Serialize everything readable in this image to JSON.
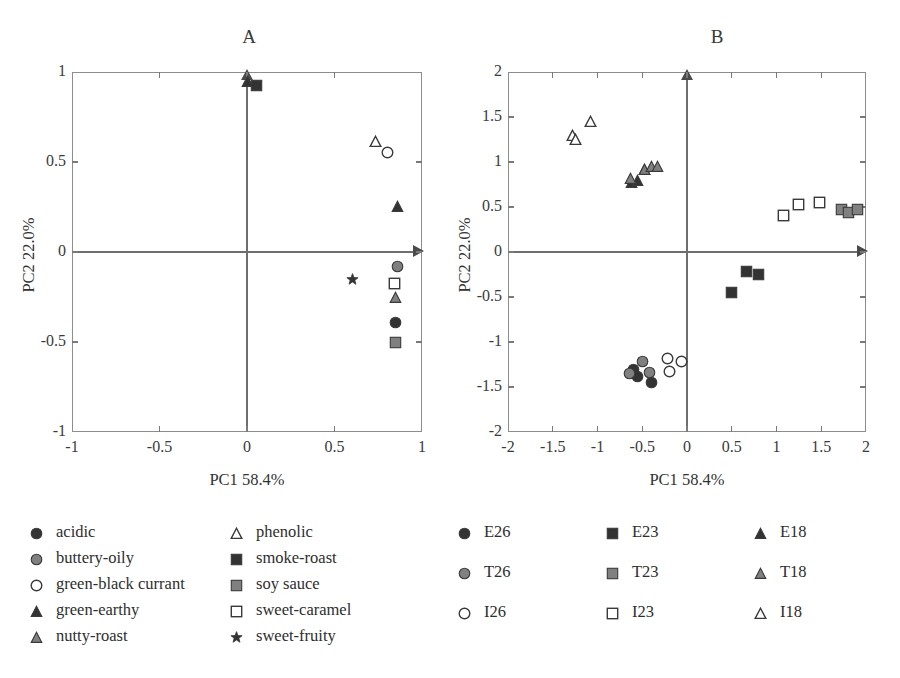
{
  "figure": {
    "panels": [
      {
        "id": "A",
        "label": "A"
      },
      {
        "id": "B",
        "label": "B"
      }
    ]
  },
  "colors": {
    "dark": "#333333",
    "mid_gray": "#808080",
    "white_fill": "#ffffff",
    "outline": "#3a3a3a",
    "axis": "#6e6e6e",
    "frame": "#8d8d8d"
  },
  "chart_data": [
    {
      "type": "scatter",
      "id": "panel-a",
      "title": "A",
      "xlabel": "PC1 58.4%",
      "ylabel": "PC2 22.0%",
      "xlim": [
        -1,
        1
      ],
      "ylim": [
        -1,
        1
      ],
      "xticks": [
        -1,
        -0.5,
        0,
        0.5,
        1
      ],
      "xticklabels": [
        "-1",
        "-0.5",
        "0",
        "0.5",
        "1"
      ],
      "yticks": [
        -1,
        -0.5,
        0,
        0.5,
        1
      ],
      "yticklabels": [
        "-1",
        "-0.5",
        "0",
        "0.5",
        "1"
      ],
      "grid": false,
      "legend_position": "below",
      "series": [
        {
          "name": "acidic",
          "marker": "circle-filled",
          "x": [
            0.85
          ],
          "y": [
            -0.39
          ]
        },
        {
          "name": "buttery-oily",
          "marker": "circle-gray",
          "x": [
            0.86
          ],
          "y": [
            -0.08
          ]
        },
        {
          "name": "green-black currant",
          "marker": "circle-open",
          "x": [
            0.8
          ],
          "y": [
            0.555
          ]
        },
        {
          "name": "green-earthy",
          "marker": "triangle-filled",
          "x": [
            0.0,
            0.86
          ],
          "y": [
            0.945,
            0.255
          ]
        },
        {
          "name": "nutty-roast",
          "marker": "triangle-gray",
          "x": [
            0.85
          ],
          "y": [
            -0.255
          ]
        },
        {
          "name": "phenolic",
          "marker": "triangle-open",
          "x": [
            0.735
          ],
          "y": [
            0.615
          ]
        },
        {
          "name": "smoke-roast",
          "marker": "square-filled",
          "x": [
            0.055
          ],
          "y": [
            0.925
          ]
        },
        {
          "name": "soy sauce",
          "marker": "square-gray",
          "x": [
            0.85
          ],
          "y": [
            -0.5
          ]
        },
        {
          "name": "sweet-caramel",
          "marker": "square-open",
          "x": [
            0.84
          ],
          "y": [
            -0.175
          ]
        },
        {
          "name": "sweet-fruity",
          "marker": "star-filled",
          "x": [
            0.6
          ],
          "y": [
            -0.15
          ]
        }
      ],
      "legend": [
        {
          "label": "acidic",
          "marker": "circle-filled"
        },
        {
          "label": "buttery-oily",
          "marker": "circle-gray"
        },
        {
          "label": "green-black currant",
          "marker": "circle-open"
        },
        {
          "label": "green-earthy",
          "marker": "triangle-filled"
        },
        {
          "label": "nutty-roast",
          "marker": "triangle-gray"
        },
        {
          "label": "phenolic",
          "marker": "triangle-open"
        },
        {
          "label": "smoke-roast",
          "marker": "square-filled"
        },
        {
          "label": "soy sauce",
          "marker": "square-gray"
        },
        {
          "label": "sweet-caramel",
          "marker": "square-open"
        },
        {
          "label": "sweet-fruity",
          "marker": "star-filled"
        }
      ]
    },
    {
      "type": "scatter",
      "id": "panel-b",
      "title": "B",
      "xlabel": "PC1 58.4%",
      "ylabel": "PC2 22.0%",
      "xlim": [
        -2,
        2
      ],
      "ylim": [
        -2,
        2
      ],
      "xticks": [
        -2,
        -1.5,
        -1,
        -0.5,
        0,
        0.5,
        1,
        1.5,
        2
      ],
      "xticklabels": [
        "-2",
        "-1.5",
        "-1",
        "-0.5",
        "0",
        "0.5",
        "1",
        "1.5",
        "2"
      ],
      "yticks": [
        -2,
        -1.5,
        -1,
        -0.5,
        0,
        0.5,
        1,
        1.5,
        2
      ],
      "yticklabels": [
        "-2",
        "-1.5",
        "-1",
        "-0.5",
        "0",
        "0.5",
        "1",
        "1.5",
        "2"
      ],
      "grid": false,
      "legend_position": "below",
      "series": [
        {
          "name": "E26",
          "marker": "circle-filled",
          "x": [
            -0.6,
            -0.55,
            -0.4
          ],
          "y": [
            -1.3,
            -1.38,
            -1.45
          ]
        },
        {
          "name": "T26",
          "marker": "circle-gray",
          "x": [
            -0.64,
            -0.5,
            -0.42
          ],
          "y": [
            -1.35,
            -1.22,
            -1.34
          ]
        },
        {
          "name": "I26",
          "marker": "circle-open",
          "x": [
            -0.22,
            -0.2,
            -0.06
          ],
          "y": [
            -1.18,
            -1.33,
            -1.22
          ]
        },
        {
          "name": "E23",
          "marker": "square-filled",
          "x": [
            0.5,
            0.66,
            0.8
          ],
          "y": [
            -0.45,
            -0.22,
            -0.25
          ]
        },
        {
          "name": "T23",
          "marker": "square-gray",
          "x": [
            1.73,
            1.8,
            1.9
          ],
          "y": [
            0.47,
            0.44,
            0.47
          ]
        },
        {
          "name": "I23",
          "marker": "square-open",
          "x": [
            1.08,
            1.25,
            1.48
          ],
          "y": [
            0.41,
            0.53,
            0.55
          ]
        },
        {
          "name": "E18",
          "marker": "triangle-filled",
          "x": [
            -0.62,
            -0.55,
            -0.48
          ],
          "y": [
            0.77,
            0.8,
            0.92
          ]
        },
        {
          "name": "T18",
          "marker": "triangle-gray",
          "x": [
            -0.63,
            -0.47,
            -0.4,
            -0.33
          ],
          "y": [
            0.82,
            0.92,
            0.95,
            0.95
          ]
        },
        {
          "name": "I18",
          "marker": "triangle-open",
          "x": [
            -1.28,
            -1.25,
            -1.08
          ],
          "y": [
            1.3,
            1.25,
            1.45
          ]
        }
      ],
      "legend": [
        {
          "label": "E26",
          "marker": "circle-filled"
        },
        {
          "label": "E23",
          "marker": "square-filled"
        },
        {
          "label": "E18",
          "marker": "triangle-filled"
        },
        {
          "label": "T26",
          "marker": "circle-gray"
        },
        {
          "label": "T23",
          "marker": "square-gray"
        },
        {
          "label": "T18",
          "marker": "triangle-gray"
        },
        {
          "label": "I26",
          "marker": "circle-open"
        },
        {
          "label": "I23",
          "marker": "square-open"
        },
        {
          "label": "I18",
          "marker": "triangle-open"
        }
      ]
    }
  ]
}
